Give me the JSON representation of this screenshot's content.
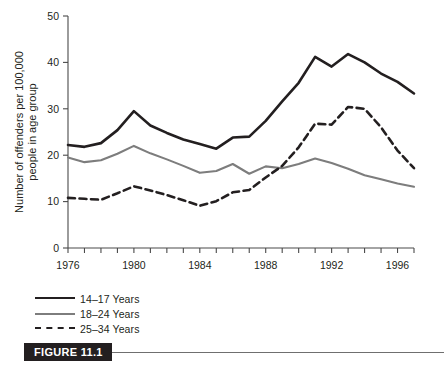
{
  "figure": {
    "caption_label": "FIGURE 11.1"
  },
  "legend": {
    "items": [
      {
        "label": "14–17 Years",
        "style": "solid",
        "color": "#231f20",
        "swatch": "sw-solid-black"
      },
      {
        "label": "18–24 Years",
        "style": "solid",
        "color": "#7d7d7d",
        "swatch": "sw-solid-gray"
      },
      {
        "label": "25–34 Years",
        "style": "dashed",
        "color": "#231f20",
        "swatch": "sw-dashed-black"
      }
    ]
  },
  "chart_data": {
    "type": "line",
    "title": "",
    "xlabel": "",
    "ylabel": "Number of offenders per 100,000 people in age group",
    "ylabel_line1": "Number of offenders per 100,000",
    "ylabel_line2": "people in age group",
    "xlim": [
      1976,
      1997
    ],
    "ylim": [
      0,
      50
    ],
    "yticks": [
      0,
      10,
      20,
      30,
      40,
      50
    ],
    "ytick_labels": [
      "0",
      "10",
      "20",
      "30",
      "40",
      "50"
    ],
    "xticks": [
      1976,
      1977,
      1978,
      1979,
      1980,
      1981,
      1982,
      1983,
      1984,
      1985,
      1986,
      1987,
      1988,
      1989,
      1990,
      1991,
      1992,
      1993,
      1994,
      1995,
      1996,
      1997
    ],
    "xtick_labels_shown": [
      "1976",
      "1980",
      "1984",
      "1988",
      "1992",
      "1996"
    ],
    "xtick_labels_shown_values": [
      1976,
      1980,
      1984,
      1988,
      1992,
      1996
    ],
    "grid": false,
    "legend_position": "below-left",
    "x": [
      1976,
      1977,
      1978,
      1979,
      1980,
      1981,
      1982,
      1983,
      1984,
      1985,
      1986,
      1987,
      1988,
      1989,
      1990,
      1991,
      1992,
      1993,
      1994,
      1995,
      1996,
      1997
    ],
    "series": [
      {
        "name": "14–17 Years",
        "color": "#231f20",
        "style": "solid",
        "width": 2.6,
        "values": [
          22.2,
          21.8,
          22.6,
          25.4,
          29.5,
          26.4,
          24.8,
          23.4,
          22.4,
          21.4,
          23.8,
          24.0,
          27.4,
          31.6,
          35.6,
          41.2,
          39.1,
          41.8,
          40.0,
          37.6,
          35.8,
          33.3
        ]
      },
      {
        "name": "18–24 Years",
        "color": "#7d7d7d",
        "style": "solid",
        "width": 2.1,
        "values": [
          19.5,
          18.5,
          18.9,
          20.3,
          22.0,
          20.4,
          19.1,
          17.7,
          16.2,
          16.6,
          18.1,
          16.0,
          17.6,
          17.2,
          18.1,
          19.3,
          18.3,
          17.1,
          15.7,
          14.8,
          13.9,
          13.2
        ]
      },
      {
        "name": "25–34 Years",
        "color": "#231f20",
        "style": "dashed",
        "width": 2.6,
        "values": [
          10.8,
          10.6,
          10.4,
          11.8,
          13.3,
          12.4,
          11.4,
          10.3,
          9.1,
          10.1,
          12.0,
          12.5,
          15.2,
          17.7,
          21.7,
          26.8,
          26.6,
          30.4,
          30.0,
          26.0,
          21.0,
          17.2
        ]
      }
    ]
  }
}
